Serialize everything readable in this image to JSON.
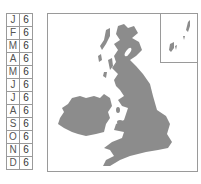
{
  "months": [
    {
      "label": "J",
      "value": "6"
    },
    {
      "label": "F",
      "value": "6"
    },
    {
      "label": "M",
      "value": "6"
    },
    {
      "label": "A",
      "value": "6"
    },
    {
      "label": "M",
      "value": "6"
    },
    {
      "label": "J",
      "value": "6"
    },
    {
      "label": "J",
      "value": "6"
    },
    {
      "label": "A",
      "value": "6"
    },
    {
      "label": "S",
      "value": "6"
    },
    {
      "label": "O",
      "value": "6"
    },
    {
      "label": "N",
      "value": "6"
    },
    {
      "label": "D",
      "value": "6"
    }
  ],
  "map": {
    "region": "British Isles",
    "land_color": "#8c8c8c",
    "border_color": "#9a9a9a",
    "inset": "Shetland Islands"
  }
}
